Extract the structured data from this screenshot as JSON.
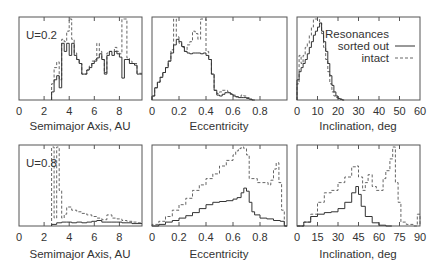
{
  "legend": {
    "title": "Resonances",
    "entries": [
      {
        "label": "sorted out",
        "style": "solid"
      },
      {
        "label": "intact",
        "style": "dashed"
      }
    ]
  },
  "chart_data": [
    {
      "type": "line",
      "panel": "top-left",
      "annotation": "U=0.2",
      "xlabel": "Semimajor Axis, AU",
      "xlim": [
        0,
        9.8
      ],
      "ylim": [
        0,
        1
      ],
      "xticks": [
        0,
        2,
        4,
        6,
        8
      ],
      "xtick_labels": [
        "0",
        "2",
        "4",
        "6",
        "8"
      ],
      "series": [
        {
          "name": "sorted out",
          "style": "solid",
          "x": [
            2.6,
            2.8,
            3.0,
            3.2,
            3.4,
            3.6,
            3.8,
            4.0,
            4.2,
            4.4,
            4.6,
            4.8,
            5.0,
            5.2,
            5.4,
            5.6,
            5.8,
            6.0,
            6.2,
            6.4,
            6.6,
            6.8,
            7.0,
            7.2,
            7.4,
            7.6,
            7.8,
            8.0,
            8.2,
            8.4,
            8.6,
            8.8,
            9.0,
            9.2,
            9.4,
            9.6
          ],
          "y": [
            0.1,
            0.25,
            0.3,
            0.15,
            0.7,
            0.6,
            0.7,
            0.55,
            0.7,
            0.55,
            0.5,
            0.45,
            0.32,
            0.32,
            0.37,
            0.4,
            0.45,
            0.48,
            0.52,
            0.57,
            0.5,
            0.32,
            0.55,
            0.6,
            0.55,
            0.6,
            0.57,
            0.53,
            0.27,
            0.5,
            0.5,
            0.45,
            0.45,
            0.43,
            0.32,
            0.32
          ]
        },
        {
          "name": "intact",
          "style": "dashed",
          "x": [
            2.6,
            2.8,
            3.0,
            3.2,
            3.4,
            3.6,
            3.8,
            4.0,
            4.2,
            4.4,
            4.6,
            4.8,
            5.0,
            5.2,
            5.4,
            5.6,
            5.8,
            6.0,
            6.2,
            6.4,
            6.6,
            6.8,
            7.0,
            7.2,
            7.4,
            7.6,
            7.8,
            8.0,
            8.2,
            8.4,
            8.6,
            8.8,
            9.0,
            9.2,
            9.4,
            9.6
          ],
          "y": [
            0.2,
            0.4,
            0.47,
            0.25,
            0.75,
            0.72,
            0.85,
            1.0,
            0.75,
            0.58,
            0.5,
            0.45,
            0.32,
            0.32,
            0.37,
            0.42,
            0.48,
            0.5,
            0.7,
            0.6,
            0.5,
            0.34,
            0.58,
            0.6,
            0.6,
            0.65,
            0.6,
            0.57,
            1.0,
            1.0,
            0.52,
            0.48,
            0.45,
            0.45,
            0.33,
            0.33
          ]
        }
      ]
    },
    {
      "type": "line",
      "panel": "top-middle",
      "xlabel": "Eccentricity",
      "xlim": [
        0,
        1
      ],
      "ylim": [
        0,
        1
      ],
      "xticks": [
        0,
        0.2,
        0.4,
        0.6,
        0.8
      ],
      "xtick_labels": [
        "0",
        "0.2",
        "0.4",
        "0.6",
        "0.8"
      ],
      "series": [
        {
          "name": "sorted out",
          "style": "solid",
          "x": [
            0.0,
            0.02,
            0.04,
            0.06,
            0.08,
            0.1,
            0.12,
            0.14,
            0.16,
            0.18,
            0.2,
            0.22,
            0.24,
            0.26,
            0.28,
            0.3,
            0.32,
            0.34,
            0.36,
            0.38,
            0.4,
            0.42,
            0.44,
            0.46,
            0.48,
            0.5,
            0.52,
            0.54,
            0.56,
            0.58,
            0.6,
            0.62,
            0.64,
            0.66,
            0.68,
            0.7,
            0.72,
            0.74
          ],
          "y": [
            0.05,
            0.15,
            0.22,
            0.28,
            0.34,
            0.4,
            0.48,
            0.58,
            0.68,
            0.75,
            0.72,
            0.66,
            0.6,
            0.58,
            0.57,
            0.58,
            0.58,
            0.58,
            0.57,
            0.58,
            0.55,
            0.5,
            0.32,
            0.12,
            0.06,
            0.05,
            0.07,
            0.09,
            0.09,
            0.07,
            0.05,
            0.04,
            0.03,
            0.03,
            0.03,
            0.02,
            0.01,
            0.0
          ]
        },
        {
          "name": "intact",
          "style": "dashed",
          "x": [
            0.0,
            0.02,
            0.04,
            0.06,
            0.08,
            0.1,
            0.12,
            0.14,
            0.16,
            0.18,
            0.2,
            0.22,
            0.24,
            0.26,
            0.28,
            0.3,
            0.32,
            0.34,
            0.36,
            0.38,
            0.4,
            0.42,
            0.44,
            0.46,
            0.48,
            0.5,
            0.52,
            0.54,
            0.56,
            0.58,
            0.6,
            0.62,
            0.64,
            0.66,
            0.68,
            0.7,
            0.72,
            0.74
          ],
          "y": [
            0.05,
            0.15,
            0.22,
            0.28,
            0.34,
            0.4,
            0.48,
            0.62,
            1.0,
            0.78,
            0.7,
            0.65,
            0.6,
            0.68,
            0.72,
            0.85,
            0.82,
            0.75,
            1.0,
            1.0,
            0.6,
            0.5,
            0.32,
            0.12,
            0.08,
            0.1,
            0.12,
            0.12,
            0.1,
            0.08,
            0.06,
            0.04,
            0.04,
            0.06,
            0.05,
            0.03,
            0.01,
            0.0
          ]
        }
      ]
    },
    {
      "type": "line",
      "panel": "top-right",
      "xlabel": "Inclination, deg",
      "xlim": [
        0,
        60
      ],
      "ylim": [
        0,
        1
      ],
      "xticks": [
        0,
        10,
        20,
        30,
        40,
        50,
        60
      ],
      "xtick_labels": [
        "0",
        "10",
        "20",
        "30",
        "40",
        "50",
        "60"
      ],
      "series": [
        {
          "name": "sorted out",
          "style": "solid",
          "x": [
            0,
            1,
            2,
            3,
            4,
            5,
            6,
            7,
            8,
            9,
            10,
            11,
            12,
            13,
            14,
            15,
            16,
            17,
            18,
            19,
            20,
            21,
            22
          ],
          "y": [
            0.25,
            0.35,
            0.4,
            0.45,
            0.5,
            0.57,
            0.65,
            0.72,
            0.8,
            0.85,
            0.9,
            0.95,
            0.85,
            0.72,
            0.6,
            0.45,
            0.3,
            0.18,
            0.1,
            0.05,
            0.02,
            0.01,
            0.0
          ]
        },
        {
          "name": "intact",
          "style": "dashed",
          "x": [
            0,
            1,
            2,
            3,
            4,
            5,
            6,
            7,
            8,
            9,
            10,
            11,
            12,
            13,
            14,
            15,
            16,
            17,
            18,
            19,
            20,
            21,
            22
          ],
          "y": [
            0.2,
            0.55,
            0.45,
            0.55,
            0.65,
            0.7,
            0.8,
            0.9,
            1.0,
            1.0,
            1.0,
            0.95,
            0.82,
            0.65,
            0.5,
            0.35,
            0.2,
            0.1,
            0.05,
            0.03,
            0.02,
            0.01,
            0.0
          ]
        }
      ]
    },
    {
      "type": "line",
      "panel": "bottom-left",
      "annotation": "U=0.8",
      "xlabel": "Semimajor Axis, AU",
      "xlim": [
        0,
        9.8
      ],
      "ylim": [
        0,
        1
      ],
      "xticks": [
        0,
        2,
        4,
        6,
        8
      ],
      "xtick_labels": [
        "0",
        "2",
        "4",
        "6",
        "8"
      ],
      "series": [
        {
          "name": "sorted out",
          "style": "solid",
          "x": [
            2.6,
            3.0,
            3.4,
            3.8,
            4.2,
            4.6,
            5.0,
            5.4,
            5.8,
            6.2,
            6.6,
            7.0,
            7.4,
            7.8,
            8.2,
            8.6,
            9.0,
            9.4
          ],
          "y": [
            0.02,
            0.04,
            0.05,
            0.05,
            0.04,
            0.05,
            0.04,
            0.05,
            0.06,
            0.07,
            0.05,
            0.05,
            0.05,
            0.05,
            0.04,
            0.04,
            0.03,
            0.03
          ]
        },
        {
          "name": "intact",
          "style": "dashed",
          "x": [
            2.6,
            2.8,
            3.0,
            3.2,
            3.4,
            3.6,
            3.8,
            4.2,
            4.6,
            5.0,
            5.4,
            5.8,
            6.2,
            6.6,
            7.0,
            7.4,
            7.8,
            8.2,
            8.6,
            9.0,
            9.4
          ],
          "y": [
            1.0,
            0.1,
            1.0,
            0.45,
            0.1,
            0.15,
            0.24,
            0.2,
            0.18,
            0.16,
            0.14,
            0.12,
            0.1,
            0.08,
            0.14,
            0.1,
            0.09,
            0.07,
            0.06,
            0.05,
            0.04
          ]
        }
      ]
    },
    {
      "type": "line",
      "panel": "bottom-middle",
      "xlabel": "Eccentricity",
      "xlim": [
        0,
        1
      ],
      "ylim": [
        0,
        1
      ],
      "xticks": [
        0,
        0.2,
        0.4,
        0.6,
        0.8
      ],
      "xtick_labels": [
        "0",
        "0.2",
        "0.4",
        "0.6",
        "0.8"
      ],
      "series": [
        {
          "name": "sorted out",
          "style": "solid",
          "x": [
            0.0,
            0.05,
            0.1,
            0.15,
            0.2,
            0.25,
            0.3,
            0.35,
            0.4,
            0.45,
            0.5,
            0.55,
            0.6,
            0.63,
            0.66,
            0.68,
            0.7,
            0.72,
            0.74,
            0.76,
            0.8,
            0.85,
            0.9,
            0.95,
            0.98
          ],
          "y": [
            0.0,
            0.02,
            0.05,
            0.07,
            0.1,
            0.13,
            0.17,
            0.22,
            0.27,
            0.3,
            0.31,
            0.32,
            0.34,
            0.36,
            0.42,
            0.48,
            0.44,
            0.3,
            0.18,
            0.14,
            0.1,
            0.09,
            0.07,
            0.06,
            0.0
          ]
        },
        {
          "name": "intact",
          "style": "dashed",
          "x": [
            0.0,
            0.05,
            0.1,
            0.15,
            0.2,
            0.25,
            0.3,
            0.35,
            0.4,
            0.45,
            0.5,
            0.55,
            0.6,
            0.62,
            0.64,
            0.66,
            0.68,
            0.7,
            0.72,
            0.74,
            0.78,
            0.82,
            0.86,
            0.88,
            0.9,
            0.92,
            0.94,
            0.96,
            0.98
          ],
          "y": [
            0.02,
            0.06,
            0.12,
            0.2,
            0.27,
            0.35,
            0.45,
            0.52,
            0.6,
            0.66,
            0.76,
            0.83,
            0.9,
            0.95,
            0.98,
            1.0,
            0.98,
            0.9,
            0.6,
            0.6,
            0.55,
            0.55,
            0.52,
            0.58,
            0.72,
            0.8,
            0.55,
            0.2,
            0.0
          ]
        }
      ]
    },
    {
      "type": "line",
      "panel": "bottom-right",
      "xlabel": "Inclination, deg",
      "xlim": [
        0,
        90
      ],
      "ylim": [
        0,
        1
      ],
      "xticks": [
        0,
        15,
        30,
        45,
        60,
        75,
        90
      ],
      "xtick_labels": [
        "0",
        "15",
        "30",
        "45",
        "60",
        "75",
        "90"
      ],
      "series": [
        {
          "name": "sorted out",
          "style": "solid",
          "x": [
            0,
            5,
            10,
            15,
            20,
            25,
            30,
            35,
            40,
            43,
            45,
            47,
            50,
            55,
            60,
            65
          ],
          "y": [
            0.0,
            0.05,
            0.12,
            0.15,
            0.17,
            0.18,
            0.22,
            0.3,
            0.42,
            0.5,
            0.4,
            0.25,
            0.12,
            0.04,
            0.01,
            0.0
          ]
        },
        {
          "name": "intact",
          "style": "dashed",
          "x": [
            0,
            5,
            10,
            15,
            20,
            25,
            30,
            35,
            40,
            43,
            45,
            48,
            50,
            52,
            55,
            58,
            60,
            63,
            65,
            68,
            70,
            72,
            74,
            76,
            80,
            85,
            88,
            90
          ],
          "y": [
            0.0,
            0.05,
            0.15,
            0.3,
            0.42,
            0.45,
            0.55,
            0.62,
            0.75,
            0.76,
            0.62,
            0.45,
            0.55,
            0.65,
            0.5,
            0.45,
            0.45,
            0.6,
            0.7,
            0.85,
            1.0,
            0.55,
            0.3,
            0.05,
            0.02,
            0.0,
            0.15,
            0.0
          ]
        }
      ]
    }
  ]
}
